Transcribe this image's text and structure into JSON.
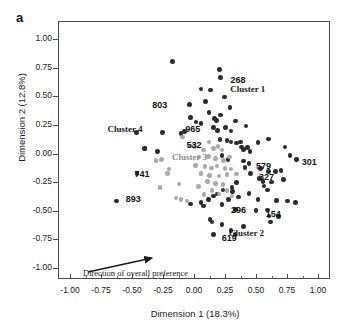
{
  "panel": {
    "label": "a"
  },
  "axes": {
    "xlabel": "Dimension  1 (18.3%)",
    "ylabel": "Dimension 2 (12.8%)",
    "xticks": [
      "-1.00",
      "-0.75",
      "-0.50",
      "-0.25",
      "0.00",
      "0.25",
      "0.50",
      "0.75",
      "1.00"
    ],
    "yticks": [
      "1.00",
      "0.75",
      "0.50",
      "0.25",
      "0.00",
      "-0.25",
      "-0.50",
      "-0.75",
      "-1.00"
    ]
  },
  "annotation": {
    "arrow_text": "Direction of  overall preference"
  },
  "clusters": [
    {
      "name": "Cluster 1",
      "color": "#1a1a1a",
      "x": 0.47,
      "y": 0.555
    },
    {
      "name": "Cluster 2",
      "color": "#1a1a1a",
      "x": 0.46,
      "y": -0.7
    },
    {
      "name": "Cluster 3",
      "color": "#8e8e8e",
      "x": 0.0,
      "y": -0.035
    },
    {
      "name": "Cluster 4",
      "color": "#1a1a1a",
      "x": -0.52,
      "y": 0.205
    }
  ],
  "point_labels": [
    {
      "id": "803",
      "x": -0.36,
      "y": 0.42
    },
    {
      "id": "965",
      "x": -0.095,
      "y": 0.215
    },
    {
      "id": "532",
      "x": -0.085,
      "y": 0.075
    },
    {
      "id": "741",
      "x": -0.505,
      "y": -0.175
    },
    {
      "id": "893",
      "x": -0.575,
      "y": -0.4
    },
    {
      "id": "268",
      "x": 0.27,
      "y": 0.645
    },
    {
      "id": "301",
      "x": 0.845,
      "y": -0.075
    },
    {
      "id": "579",
      "x": 0.475,
      "y": -0.105
    },
    {
      "id": "327",
      "x": 0.5,
      "y": -0.205
    },
    {
      "id": "296",
      "x": 0.275,
      "y": -0.49
    },
    {
      "id": "154",
      "x": 0.555,
      "y": -0.525
    },
    {
      "id": "619",
      "x": 0.2,
      "y": -0.735
    }
  ],
  "chart_data": {
    "type": "scatter",
    "title": "a",
    "xlabel": "Dimension  1 (18.3%)",
    "ylabel": "Dimension 2 (12.8%)",
    "xlim": [
      -1.125,
      1.1
    ],
    "ylim": [
      -1.15,
      1.145
    ],
    "grid": false,
    "legend": "none",
    "series": [
      {
        "name": "dark-points",
        "color": "#2b2b2b",
        "points": [
          [
            -0.175,
            0.805
          ],
          [
            0.055,
            0.565
          ],
          [
            0.205,
            0.735
          ],
          [
            0.215,
            0.665
          ],
          [
            -0.035,
            0.43
          ],
          [
            -0.03,
            0.315
          ],
          [
            0.095,
            0.455
          ],
          [
            0.12,
            0.36
          ],
          [
            0.015,
            0.275
          ],
          [
            0.055,
            0.26
          ],
          [
            -0.075,
            0.19
          ],
          [
            -0.105,
            0.175
          ],
          [
            -0.255,
            0.185
          ],
          [
            -0.395,
            0.045
          ],
          [
            0.135,
            0.555
          ],
          [
            0.245,
            0.495
          ],
          [
            0.165,
            0.305
          ],
          [
            0.18,
            0.29
          ],
          [
            0.215,
            0.335
          ],
          [
            0.29,
            0.4
          ],
          [
            0.155,
            0.225
          ],
          [
            0.19,
            0.2
          ],
          [
            0.255,
            0.225
          ],
          [
            0.335,
            0.285
          ],
          [
            0.3,
            0.195
          ],
          [
            0.42,
            0.24
          ],
          [
            0.21,
            0.12
          ],
          [
            0.265,
            0.115
          ],
          [
            0.3,
            0.1
          ],
          [
            0.345,
            0.09
          ],
          [
            0.375,
            0.1
          ],
          [
            0.385,
            0.055
          ],
          [
            0.4,
            0.035
          ],
          [
            0.43,
            0.05
          ],
          [
            0.45,
            0.02
          ],
          [
            0.515,
            0.095
          ],
          [
            0.6,
            0.125
          ],
          [
            0.735,
            0.055
          ],
          [
            0.775,
            -0.015
          ],
          [
            0.225,
            -0.02
          ],
          [
            0.275,
            -0.055
          ],
          [
            0.4,
            -0.065
          ],
          [
            0.445,
            -0.085
          ],
          [
            0.41,
            -0.12
          ],
          [
            0.455,
            -0.175
          ],
          [
            0.535,
            -0.13
          ],
          [
            0.6,
            -0.155
          ],
          [
            0.655,
            -0.155
          ],
          [
            0.7,
            -0.15
          ],
          [
            0.53,
            -0.22
          ],
          [
            0.555,
            -0.245
          ],
          [
            0.565,
            -0.285
          ],
          [
            0.625,
            -0.25
          ],
          [
            0.72,
            -0.225
          ],
          [
            0.345,
            -0.255
          ],
          [
            0.305,
            -0.295
          ],
          [
            0.31,
            -0.33
          ],
          [
            0.235,
            -0.32
          ],
          [
            0.185,
            -0.355
          ],
          [
            0.155,
            -0.37
          ],
          [
            0.115,
            -0.4
          ],
          [
            0.055,
            -0.43
          ],
          [
            -0.03,
            -0.44
          ],
          [
            0.075,
            -0.46
          ],
          [
            0.225,
            -0.445
          ],
          [
            0.28,
            -0.4
          ],
          [
            0.36,
            -0.38
          ],
          [
            0.445,
            -0.35
          ],
          [
            0.515,
            -0.4
          ],
          [
            0.595,
            -0.32
          ],
          [
            0.665,
            -0.41
          ],
          [
            0.755,
            -0.415
          ],
          [
            0.335,
            -0.49
          ],
          [
            0.5,
            -0.5
          ],
          [
            0.595,
            -0.495
          ],
          [
            0.605,
            -0.545
          ],
          [
            0.68,
            -0.55
          ],
          [
            0.615,
            -0.6
          ],
          [
            0.13,
            -0.575
          ],
          [
            0.145,
            -0.6
          ],
          [
            0.225,
            -0.62
          ],
          [
            0.4,
            -0.635
          ],
          [
            0.155,
            -0.705
          ],
          [
            0.3,
            -0.67
          ],
          [
            0.33,
            -0.705
          ],
          [
            -0.625,
            -0.415
          ],
          [
            -0.46,
            -0.175
          ],
          [
            -0.465,
            0.185
          ],
          [
            -0.4,
            0.045
          ],
          [
            -0.295,
            0.02
          ],
          [
            0.825,
            -0.055
          ],
          [
            0.82,
            -0.43
          ]
        ]
      },
      {
        "name": "gray-points",
        "color": "#a9a9a9",
        "points": [
          [
            -0.095,
            0.145
          ],
          [
            -0.03,
            0.065
          ],
          [
            0.005,
            0.06
          ],
          [
            0.12,
            0.1
          ],
          [
            0.075,
            0.03
          ],
          [
            0.155,
            0.045
          ],
          [
            0.195,
            0.06
          ],
          [
            0.225,
            0.03
          ],
          [
            0.04,
            -0.03
          ],
          [
            0.115,
            -0.025
          ],
          [
            0.175,
            -0.045
          ],
          [
            0.24,
            -0.06
          ],
          [
            0.285,
            -0.03
          ],
          [
            0.01,
            -0.105
          ],
          [
            0.09,
            -0.115
          ],
          [
            0.14,
            -0.125
          ],
          [
            0.185,
            -0.11
          ],
          [
            0.25,
            -0.13
          ],
          [
            0.055,
            -0.175
          ],
          [
            0.125,
            -0.19
          ],
          [
            0.2,
            -0.195
          ],
          [
            0.265,
            -0.185
          ],
          [
            0.11,
            -0.245
          ],
          [
            0.175,
            -0.26
          ],
          [
            0.235,
            -0.27
          ],
          [
            0.035,
            -0.29
          ],
          [
            -0.12,
            -0.265
          ],
          [
            -0.2,
            -0.135
          ],
          [
            -0.215,
            -0.175
          ],
          [
            -0.26,
            -0.055
          ],
          [
            -0.305,
            -0.06
          ],
          [
            -0.145,
            -0.39
          ],
          [
            -0.105,
            -0.4
          ],
          [
            -0.055,
            -0.415
          ],
          [
            0.08,
            -0.36
          ],
          [
            0.145,
            -0.325
          ],
          [
            0.2,
            -0.355
          ],
          [
            0.265,
            -0.325
          ],
          [
            0.305,
            -0.37
          ],
          [
            -0.275,
            -0.295
          ],
          [
            0.3,
            -0.135
          ],
          [
            0.345,
            -0.18
          ]
        ]
      }
    ]
  }
}
